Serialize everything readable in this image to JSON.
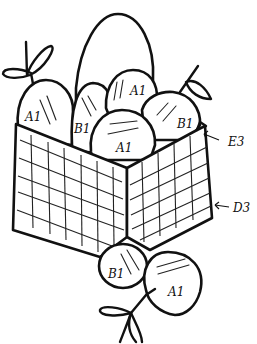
{
  "figure": {
    "eggs": [
      {
        "id": "egg-left",
        "label": "A1"
      },
      {
        "id": "egg-mid-left",
        "label": "B1"
      },
      {
        "id": "egg-top-middle",
        "label": "A1"
      },
      {
        "id": "egg-right",
        "label": "B1"
      },
      {
        "id": "egg-front",
        "label": "A1"
      },
      {
        "id": "egg-back-tall",
        "label": ""
      }
    ],
    "balloons": [
      {
        "id": "balloon-left",
        "label": "B1"
      },
      {
        "id": "balloon-right",
        "label": "A1"
      }
    ],
    "callouts": [
      {
        "id": "callout-rim",
        "label": "E3"
      },
      {
        "id": "callout-side",
        "label": "D3"
      }
    ],
    "colors": {
      "stroke": "#111111",
      "background": "#ffffff"
    }
  }
}
